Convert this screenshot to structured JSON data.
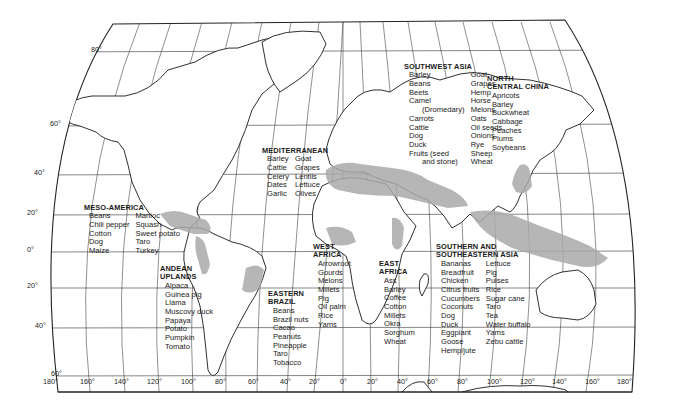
{
  "map": {
    "projection": "Robinson-style world map",
    "shading_color": "#a9a9a9",
    "line_color": "#222222",
    "latitude_labels": [
      {
        "label": "80°",
        "x": 91,
        "y": 50
      },
      {
        "label": "60°",
        "x": 50,
        "y": 124
      },
      {
        "label": "40°",
        "x": 34,
        "y": 173
      },
      {
        "label": "20°",
        "x": 27,
        "y": 213
      },
      {
        "label": "0°",
        "x": 27,
        "y": 250
      },
      {
        "label": "20°",
        "x": 27,
        "y": 286
      },
      {
        "label": "40°",
        "x": 35,
        "y": 326
      },
      {
        "label": "60°",
        "x": 51,
        "y": 374
      }
    ],
    "longitude_labels": [
      {
        "label": "180°",
        "x": 43
      },
      {
        "label": "160°",
        "x": 80
      },
      {
        "label": "140°",
        "x": 114
      },
      {
        "label": "120°",
        "x": 147
      },
      {
        "label": "100°",
        "x": 181
      },
      {
        "label": "80°",
        "x": 215
      },
      {
        "label": "60°",
        "x": 248
      },
      {
        "label": "40°",
        "x": 280
      },
      {
        "label": "20°",
        "x": 309
      },
      {
        "label": "0°",
        "x": 340
      },
      {
        "label": "20°",
        "x": 367
      },
      {
        "label": "40°",
        "x": 397
      },
      {
        "label": "60°",
        "x": 427
      },
      {
        "label": "80°",
        "x": 457
      },
      {
        "label": "100°",
        "x": 487
      },
      {
        "label": "120°",
        "x": 520
      },
      {
        "label": "140°",
        "x": 552
      },
      {
        "label": "160°",
        "x": 585
      },
      {
        "label": "180°",
        "x": 617
      }
    ],
    "regions": [
      {
        "id": "mediterranean",
        "title": [
          "MEDITERRANEAN"
        ],
        "columns": [
          [
            "Barley",
            "Cattle",
            "Celery",
            "Dates",
            "Garlic"
          ],
          [
            "Goat",
            "Grapes",
            "Lentils",
            "Lettuce",
            "Olives"
          ]
        ],
        "x": 262,
        "y": 147
      },
      {
        "id": "southwest-asia",
        "title": [
          "SOUTHWEST ASIA"
        ],
        "columns": [
          [
            "Barley",
            "Beans",
            "Beets",
            "Camel",
            "(Dromedary)",
            "Carrots",
            "Cattle",
            "Dog",
            "Duck",
            "Fruits (seed",
            "and stone)"
          ],
          [
            "Goat",
            "Grapes",
            "Hemp",
            "Horse",
            "Melons",
            "Oats",
            "Oil seeds",
            "Onions",
            "Rye",
            "Sheep",
            "Wheat"
          ]
        ],
        "x": 404,
        "y": 63
      },
      {
        "id": "north-central-china",
        "title": [
          "NORTH",
          "CENTRAL CHINA"
        ],
        "columns": [
          [
            "Apricots",
            "Barley",
            "Buckwheat",
            "Cabbage",
            "Peaches",
            "Plums",
            "Soybeans"
          ]
        ],
        "x": 487,
        "y": 75
      },
      {
        "id": "meso-america",
        "title": [
          "MESO-AMERICA"
        ],
        "columns": [
          [
            "Beans",
            "Chili pepper",
            "Cotton",
            "Dog",
            "Maize"
          ],
          [
            "Manioc",
            "Squash",
            "Sweet potato",
            "Taro",
            "Turkey"
          ]
        ],
        "x": 84,
        "y": 204
      },
      {
        "id": "andean-uplands",
        "title": [
          "ANDEAN",
          "UPLANDS"
        ],
        "columns": [
          [
            "Alpaca",
            "Guinea pig",
            "Llama",
            "Muscovy duck",
            "Papaya",
            "Potato",
            "Pumpkin",
            "Tomato"
          ]
        ],
        "x": 160,
        "y": 265
      },
      {
        "id": "eastern-brazil",
        "title": [
          "EASTERN",
          "BRAZIL"
        ],
        "columns": [
          [
            "Beans",
            "Brazil nuts",
            "Cacao",
            "Peanuts",
            "Pineapple",
            "Taro",
            "Tobacco"
          ]
        ],
        "x": 268,
        "y": 290
      },
      {
        "id": "west-africa",
        "title": [
          "WEST",
          "AFRICA"
        ],
        "columns": [
          [
            "Arrowroot",
            "Gourds",
            "Melons",
            "Millets",
            "Pig",
            "Oil palm",
            "Rice",
            "Yams"
          ]
        ],
        "x": 313,
        "y": 243
      },
      {
        "id": "east-africa",
        "title": [
          "EAST",
          "AFRICA"
        ],
        "columns": [
          [
            "Ass",
            "Barley",
            "Coffee",
            "Cotton",
            "Millets",
            "Okra",
            "Sorghum",
            "Wheat"
          ]
        ],
        "x": 379,
        "y": 260
      },
      {
        "id": "southern-southeastern-asia",
        "title": [
          "SOUTHERN AND",
          "SOUTHEASTERN ASIA"
        ],
        "columns": [
          [
            "Bananas",
            "Breadfruit",
            "Chicken",
            "Citrus fruits",
            "Cucumbers",
            "Coconuts",
            "Dog",
            "Duck",
            "Eggplant",
            "Goose",
            "Hemp/jute"
          ],
          [
            "Lettuce",
            "Pig",
            "Pulses",
            "Rice",
            "Sugar cane",
            "Taro",
            "Tea",
            "Water buffalo",
            "Yams",
            "Zebu cattle"
          ]
        ],
        "x": 436,
        "y": 243
      }
    ]
  }
}
